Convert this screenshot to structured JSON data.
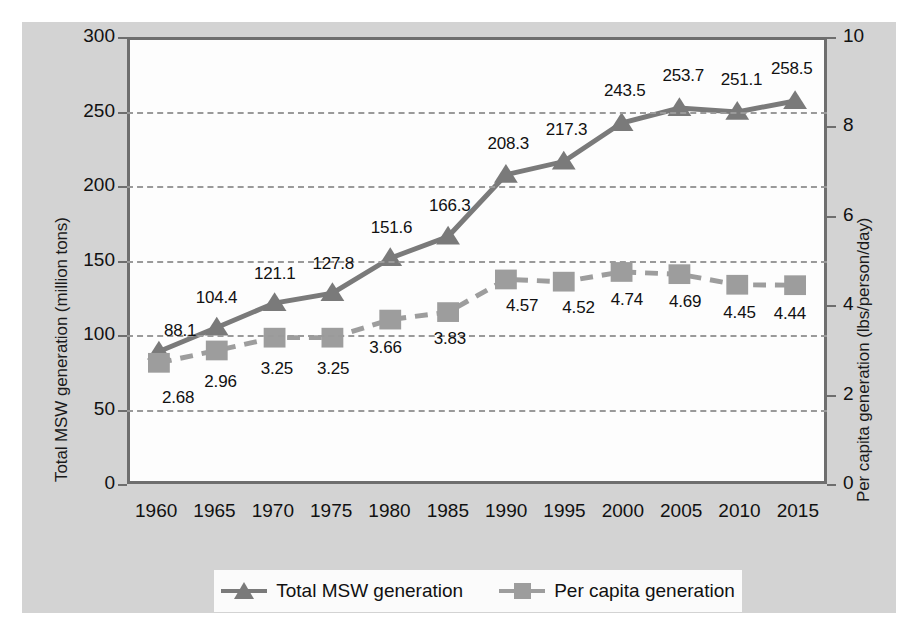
{
  "chart_data": {
    "type": "line",
    "title": "",
    "xlabel": "",
    "categories": [
      "1960",
      "1965",
      "1970",
      "1975",
      "1980",
      "1985",
      "1990",
      "1995",
      "2000",
      "2005",
      "2010",
      "2015"
    ],
    "x": [
      1960,
      1965,
      1970,
      1975,
      1980,
      1985,
      1990,
      1995,
      2000,
      2005,
      2010,
      2015
    ],
    "xlim": [
      1957.5,
      2017.5
    ],
    "grid": true,
    "legend_position": "bottom",
    "series": [
      {
        "name": "Total MSW generation",
        "axis": "left",
        "marker": "triangle",
        "linestyle": "solid",
        "color": "#7a7a7a",
        "values": [
          88.1,
          104.4,
          121.1,
          127.8,
          151.6,
          166.3,
          208.3,
          217.3,
          243.5,
          253.7,
          251.1,
          258.5
        ]
      },
      {
        "name": "Per capita generation",
        "axis": "right",
        "marker": "square",
        "linestyle": "dashed",
        "color": "#9d9d9d",
        "values": [
          2.68,
          2.96,
          3.25,
          3.25,
          3.66,
          3.83,
          4.57,
          4.52,
          4.74,
          4.69,
          4.45,
          4.44
        ]
      }
    ],
    "left_axis": {
      "label": "Total MSW generation (million tons)",
      "ticks": [
        0,
        50,
        100,
        150,
        200,
        250,
        300
      ],
      "ylim": [
        0,
        300
      ]
    },
    "right_axis": {
      "label": "Per capita generation (lbs/person/day)",
      "ticks": [
        0,
        2,
        4,
        6,
        8,
        10
      ],
      "ylim": [
        0,
        10
      ]
    },
    "point_labels": {
      "total": [
        "88.1",
        "104.4",
        "121.1",
        "127.8",
        "151.6",
        "166.3",
        "208.3",
        "217.3",
        "243.5",
        "253.7",
        "251.1",
        "258.5"
      ],
      "per_capita": [
        "2.68",
        "2.96",
        "3.25",
        "3.25",
        "3.66",
        "3.83",
        "4.57",
        "4.52",
        "4.74",
        "4.69",
        "4.45",
        "4.44"
      ]
    }
  },
  "legend": {
    "entries": [
      {
        "label": "Total MSW generation",
        "marker": "triangle-marker-icon"
      },
      {
        "label": "Per capita generation",
        "marker": "square-marker-icon"
      }
    ]
  },
  "colors": {
    "figure_background": "#d3d3d3",
    "plot_background": "#fdfdfd",
    "axis": "#6e6e6e",
    "gridline": "#9a9a9a",
    "total_series": "#7a7a7a",
    "per_capita_series": "#9d9d9d",
    "text": "#111111"
  }
}
